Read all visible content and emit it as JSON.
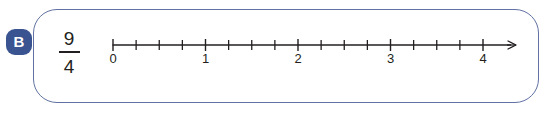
{
  "exercise": {
    "badge_label": "B",
    "fraction": {
      "numerator": "9",
      "denominator": "4"
    }
  },
  "credit": {
    "text": "Ilustrações: Sérgio L. Filho/ID/BR"
  },
  "colors": {
    "frame_border": "#6171a3",
    "badge_background": "#3a5391",
    "badge_text": "#ffffff",
    "line": "#231f20",
    "label_text": "#231f20",
    "credit_text": "#8b8b8b"
  },
  "chart_data": {
    "type": "line",
    "title": "",
    "xlabel": "",
    "ylabel": "",
    "orientation": "horizontal",
    "axis_start_value": 0,
    "axis_end_value": 4,
    "xlim": [
      0,
      4
    ],
    "grid": false,
    "legend": null,
    "arrow_end": "right",
    "minor_ticks_per_unit": 4,
    "subdivision": "quarters",
    "major_tick_labels": [
      "0",
      "1",
      "2",
      "3",
      "4"
    ],
    "major_tick_values": [
      0,
      1,
      2,
      3,
      4
    ],
    "minor_tick_values": [
      0.25,
      0.5,
      0.75,
      1.25,
      1.5,
      1.75,
      2.25,
      2.5,
      2.75,
      3.25,
      3.5,
      3.75
    ],
    "marked_points": [],
    "annotation": "9/4"
  },
  "geometry": {
    "axis_x_start": 113,
    "axis_x_end": 516,
    "axis_y": 45,
    "unit_pixels": 92.5,
    "label_y": 63
  }
}
